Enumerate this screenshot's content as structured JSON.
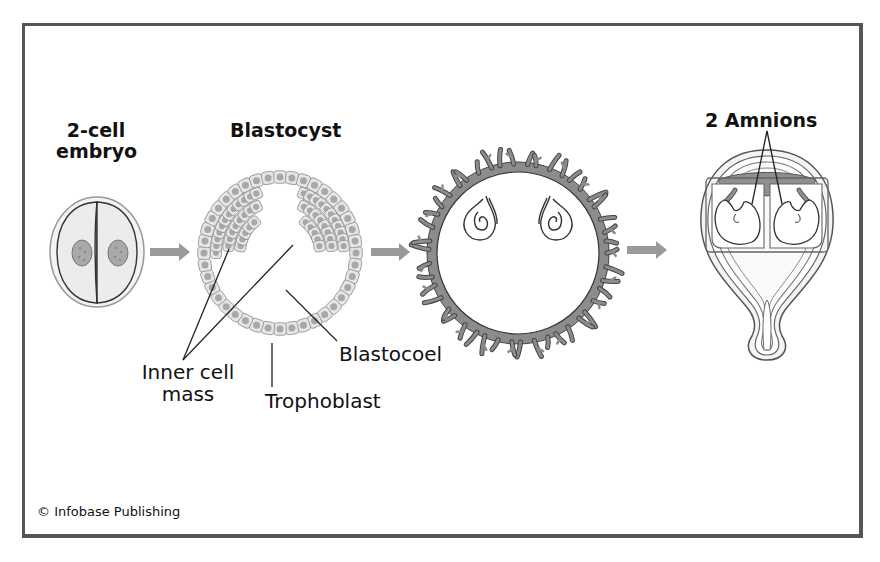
{
  "figure": {
    "stages": [
      {
        "id": "two-cell",
        "title_line1": "2-cell",
        "title_line2": "embryo"
      },
      {
        "id": "blastocyst",
        "title": "Blastocyst"
      },
      {
        "id": "implanted-embryos",
        "title": ""
      },
      {
        "id": "uterus-twins",
        "title": "2 Amnions"
      }
    ],
    "labels": {
      "inner_cell_mass_line1": "Inner cell",
      "inner_cell_mass_line2": "mass",
      "trophoblast": "Trophoblast",
      "blastocoel": "Blastocoel"
    },
    "credit": "© Infobase Publishing",
    "colors": {
      "frame": "#555555",
      "arrow": "#9a9a9a",
      "cell_fill": "#e6e6e6",
      "nucleus": "#a8a8a8",
      "tissue": "#8c8c8c",
      "line": "#222222"
    }
  }
}
